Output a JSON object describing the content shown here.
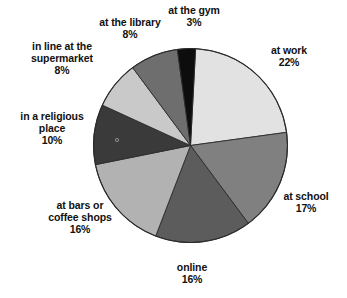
{
  "chart_data": {
    "type": "pie",
    "title": "",
    "legend_position": "labels-outside",
    "grid": false,
    "units": "percent",
    "total": 100,
    "start_angle_deg": 3,
    "direction": "clockwise",
    "categories": [
      "at work",
      "at school",
      "online",
      "at bars or coffee shops",
      "in a religious place",
      "in line at the supermarket",
      "at the library",
      "at the gym"
    ],
    "values": [
      22,
      17,
      16,
      16,
      10,
      8,
      8,
      3
    ],
    "slices": [
      {
        "name": "at work",
        "label_line1": "at work",
        "label_line2": "",
        "percent": "22%",
        "value": 22,
        "color": "#e2e2e2",
        "start_deg": 3,
        "end_deg": 82.2
      },
      {
        "name": "at school",
        "label_line1": "at school",
        "label_line2": "",
        "percent": "17%",
        "value": 17,
        "color": "#808080",
        "start_deg": 82.2,
        "end_deg": 143.4
      },
      {
        "name": "online",
        "label_line1": "online",
        "label_line2": "",
        "percent": "16%",
        "value": 16,
        "color": "#5c5c5c",
        "start_deg": 143.4,
        "end_deg": 201.0
      },
      {
        "name": "at bars or coffee shops",
        "label_line1": "at bars or",
        "label_line2": "coffee shops",
        "percent": "16%",
        "value": 16,
        "color": "#b2b2b2",
        "start_deg": 201.0,
        "end_deg": 258.6
      },
      {
        "name": "in a religious place",
        "label_line1": "in a religious",
        "label_line2": "place",
        "percent": "10%",
        "value": 10,
        "color": "#3a3a3a",
        "start_deg": 258.6,
        "end_deg": 294.6
      },
      {
        "name": "in line at the supermarket",
        "label_line1": "in line at the",
        "label_line2": "supermarket",
        "percent": "8%",
        "value": 8,
        "color": "#c9c9c9",
        "start_deg": 294.6,
        "end_deg": 323.4
      },
      {
        "name": "at the library",
        "label_line1": "at the library",
        "label_line2": "",
        "percent": "8%",
        "value": 8,
        "color": "#6e6e6e",
        "start_deg": 323.4,
        "end_deg": 352.2
      },
      {
        "name": "at the gym",
        "label_line1": "at the gym",
        "label_line2": "",
        "percent": "3%",
        "value": 3,
        "color": "#0d0d0d",
        "start_deg": 352.2,
        "end_deg": 363.0
      }
    ]
  },
  "labels": {
    "gym": {
      "name": "at the gym",
      "percent": "3%"
    },
    "work": {
      "name": "at work",
      "percent": "22%"
    },
    "school": {
      "name": "at school",
      "percent": "17%"
    },
    "online": {
      "name": "online",
      "percent": "16%"
    },
    "bars": {
      "line1": "at bars or",
      "line2": "coffee shops",
      "percent": "16%"
    },
    "religious": {
      "line1": "in a religious",
      "line2": "place",
      "percent": "10%"
    },
    "market": {
      "line1": "in line at the",
      "line2": "supermarket",
      "percent": "8%"
    },
    "library": {
      "name": "at the library",
      "percent": "8%"
    }
  },
  "geometry": {
    "center_x": 190.5,
    "center_y": 145.5,
    "radius": 97,
    "outline_color": "#2b2b2b"
  }
}
